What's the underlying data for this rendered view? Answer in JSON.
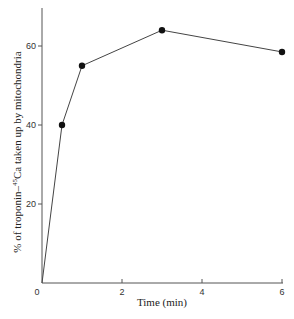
{
  "chart_data": {
    "type": "line",
    "title": "",
    "xlabel": "Time (min)",
    "ylabel": "% of troponin-45Ca taken up by mitochondria",
    "ylabel_prefix": "% of troponin–",
    "ylabel_superscript": "45",
    "ylabel_suffix": "Ca taken up by mitochondria",
    "xlim": [
      0,
      6
    ],
    "ylim": [
      0,
      70
    ],
    "x_ticks": [
      0,
      2,
      4,
      6
    ],
    "x_tick_labels": [
      "0",
      "2",
      "4",
      "6"
    ],
    "y_ticks": [
      20,
      40,
      60
    ],
    "y_tick_labels": [
      "20",
      "40",
      "60"
    ],
    "grid": false,
    "legend": null,
    "series": [
      {
        "name": "troponin-45Ca uptake",
        "marker": "filled-circle",
        "x": [
          0,
          0.5,
          1,
          3,
          6
        ],
        "y": [
          0,
          40,
          55,
          64,
          58.5
        ],
        "marked_points": [
          [
            0.5,
            40
          ],
          [
            1,
            55
          ],
          [
            3,
            64
          ],
          [
            6,
            58.5
          ]
        ]
      }
    ]
  }
}
